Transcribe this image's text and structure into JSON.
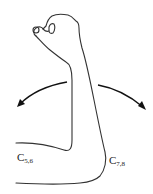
{
  "figure": {
    "labels": {
      "left": {
        "main": "C",
        "sub": "5,6"
      },
      "right": {
        "main": "C",
        "sub": "7,8"
      }
    },
    "stroke_color": "#333333"
  }
}
